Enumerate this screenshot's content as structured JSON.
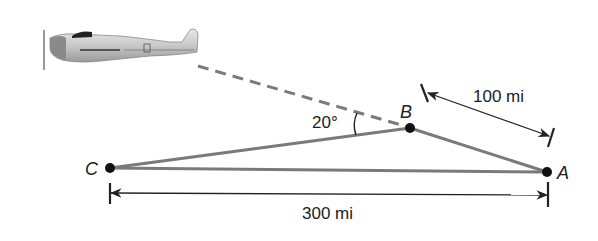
{
  "diagram": {
    "points": {
      "A": {
        "label": "A",
        "x": 547,
        "y": 172
      },
      "B": {
        "label": "B",
        "x": 410,
        "y": 128
      },
      "C": {
        "label": "C",
        "x": 110,
        "y": 168
      }
    },
    "angle_label": "20°",
    "distance_BA": "100 mi",
    "distance_CA": "300 mi",
    "colors": {
      "segment": "#7a7a7a",
      "dimension": "#222222",
      "point": "#111111",
      "dashed": "#7a7a7a"
    }
  }
}
